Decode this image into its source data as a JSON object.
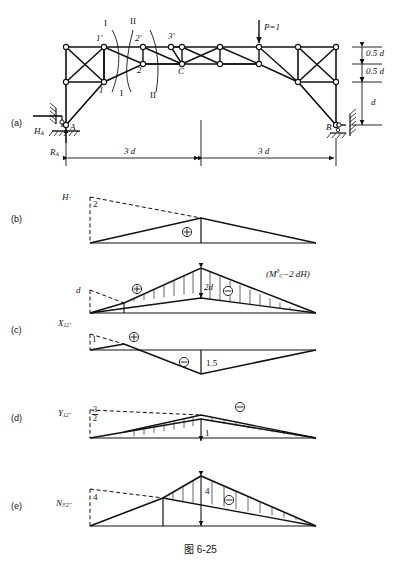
{
  "caption": "图 6-25",
  "panels": [
    {
      "key": "a",
      "label": "(a)"
    },
    {
      "key": "b",
      "label": "(b)"
    },
    {
      "key": "c",
      "label": "(c)"
    },
    {
      "key": "d",
      "label": "(d)"
    },
    {
      "key": "e",
      "label": "(e)"
    }
  ],
  "frame": {
    "joint_labels": [
      "1'",
      "2'",
      "3'",
      "1",
      "2",
      "C",
      "A",
      "B"
    ],
    "section_marks": [
      "I",
      "II",
      "I",
      "II"
    ],
    "load_label": "P=1",
    "reactions": {
      "horizontal": "H",
      "horizontal_sub": "A",
      "vertical": "R",
      "vertical_sub": "A"
    },
    "height_dims": [
      "0.5 d",
      "0.5 d",
      "d"
    ],
    "span_dims": [
      "3 d",
      "3 d"
    ]
  },
  "influence_lines": [
    {
      "key": "b",
      "name": "H",
      "ordinate_left": "2",
      "signs": [
        "+"
      ],
      "peak_label": "",
      "note": ""
    },
    {
      "key": "c_upper",
      "name": "",
      "ordinate_left": "d",
      "signs": [
        "+",
        "-"
      ],
      "peak_label": "2d",
      "note": "(M°C−2 dH)",
      "note_parts": {
        "prefix": "(M",
        "sup": "0",
        "sub": "C",
        "rest": "−2 dH)"
      }
    },
    {
      "key": "c",
      "name": "X",
      "name_sub": "12",
      "ordinate_left": "1",
      "signs": [
        "+",
        "-"
      ],
      "peak_label": "1.5",
      "note": ""
    },
    {
      "key": "d",
      "name": "Y",
      "name_sub": "12",
      "ordinate_left_frac": {
        "n": "3",
        "d": "2"
      },
      "signs": [
        "-"
      ],
      "peak_label": "1",
      "note": ""
    },
    {
      "key": "e",
      "name": "N",
      "name_sub": "3'2'",
      "ordinate_left": "4",
      "signs": [
        "-"
      ],
      "peak_label": "4",
      "note": ""
    }
  ],
  "colors": {
    "ink": "#111111",
    "hatch": "#333333",
    "dash": "#555555"
  }
}
